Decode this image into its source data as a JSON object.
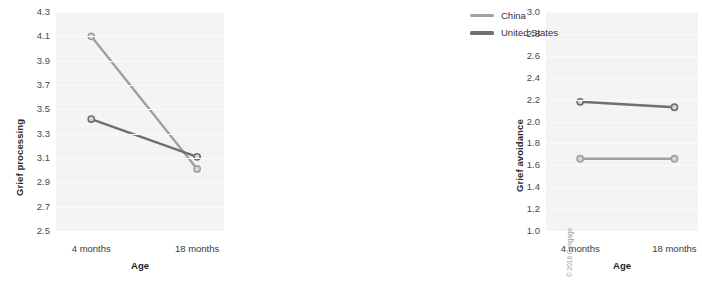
{
  "figure": {
    "background": "#ffffff",
    "plot_background": "#f4f4f4",
    "copyright": "© 2016 Cengage"
  },
  "legend": {
    "position": "right",
    "items": [
      {
        "label": "China",
        "color": "#a0a0a0"
      },
      {
        "label": "United States",
        "color": "#6f6f6f"
      }
    ]
  },
  "chart_data": [
    {
      "type": "line",
      "title": "",
      "panel": "left",
      "xlabel": "Age",
      "ylabel": "Grief processing",
      "categories": [
        "4 months",
        "18 months"
      ],
      "x": [
        0,
        1
      ],
      "ylim": [
        2.5,
        4.3
      ],
      "yticks": [
        "4.3",
        "4.1",
        "3.9",
        "3.7",
        "3.5",
        "3.3",
        "3.1",
        "2.9",
        "2.7",
        "2.5"
      ],
      "ytick_values": [
        4.3,
        4.1,
        3.9,
        3.7,
        3.5,
        3.3,
        3.1,
        2.9,
        2.7,
        2.5
      ],
      "grid": true,
      "legend": "right",
      "series": [
        {
          "name": "China",
          "color": "#a0a0a0",
          "values": [
            4.1,
            3.01
          ]
        },
        {
          "name": "United States",
          "color": "#6f6f6f",
          "values": [
            3.42,
            3.11
          ]
        }
      ]
    },
    {
      "type": "line",
      "title": "",
      "panel": "right",
      "xlabel": "Age",
      "ylabel": "Grief avoidance",
      "categories": [
        "4 months",
        "18 months"
      ],
      "x": [
        0,
        1
      ],
      "ylim": [
        1.0,
        3.0
      ],
      "yticks": [
        "3.0",
        "2.8",
        "2.6",
        "2.4",
        "2.2",
        "2.0",
        "1.8",
        "1.6",
        "1.4",
        "1.2",
        "1.0"
      ],
      "ytick_values": [
        3.0,
        2.8,
        2.6,
        2.4,
        2.2,
        2.0,
        1.8,
        1.6,
        1.4,
        1.2,
        1.0
      ],
      "grid": true,
      "legend": "right",
      "series": [
        {
          "name": "China",
          "color": "#a0a0a0",
          "values": [
            1.66,
            1.66
          ]
        },
        {
          "name": "United States",
          "color": "#6f6f6f",
          "values": [
            2.18,
            2.13
          ]
        }
      ]
    }
  ]
}
